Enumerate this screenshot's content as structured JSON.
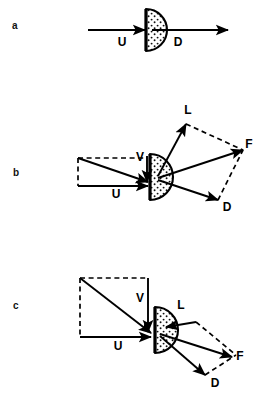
{
  "figure": {
    "type": "scientific-vector-diagram",
    "background_color": "#ffffff",
    "ink_color": "#000000",
    "panels": [
      {
        "id": "a",
        "label": "a",
        "label_x": 12,
        "label_y": 21,
        "body": {
          "shape": "half-disc-stippled",
          "center_x": 146,
          "center_y": 30,
          "radius": 21,
          "flat_edge": "left"
        },
        "vectors": [
          {
            "name": "U",
            "label": "U",
            "label_x": 122,
            "label_y": 46,
            "style": "solid",
            "x1": 88,
            "y1": 30,
            "x2": 145,
            "y2": 30
          },
          {
            "name": "D",
            "label": "D",
            "label_x": 178,
            "label_y": 46,
            "style": "solid",
            "x1": 152,
            "y1": 30,
            "x2": 228,
            "y2": 30
          }
        ],
        "dashed_construction": []
      },
      {
        "id": "b",
        "label": "b",
        "label_x": 13,
        "label_y": 168,
        "body": {
          "shape": "half-disc-stippled",
          "center_x": 150,
          "center_y": 177,
          "radius": 23,
          "flat_edge": "left"
        },
        "vectors": [
          {
            "name": "U",
            "label": "U",
            "label_x": 116,
            "label_y": 198,
            "style": "solid",
            "x1": 78,
            "y1": 186,
            "x2": 148,
            "y2": 186
          },
          {
            "name": "V",
            "label": "V",
            "label_x": 140,
            "label_y": 161,
            "style": "solid",
            "x1": 147,
            "y1": 156,
            "x2": 147,
            "y2": 182
          },
          {
            "name": "resultant",
            "label": "",
            "label_x": 0,
            "label_y": 0,
            "style": "solid",
            "x1": 78,
            "y1": 158,
            "x2": 148,
            "y2": 182
          },
          {
            "name": "L",
            "label": "L",
            "label_x": 188,
            "label_y": 114,
            "style": "solid",
            "x1": 158,
            "y1": 176,
            "x2": 186,
            "y2": 124
          },
          {
            "name": "F",
            "label": "F",
            "label_x": 249,
            "label_y": 148,
            "style": "solid",
            "x1": 158,
            "y1": 178,
            "x2": 243,
            "y2": 150
          },
          {
            "name": "D",
            "label": "D",
            "label_x": 227,
            "label_y": 211,
            "style": "solid",
            "x1": 158,
            "y1": 180,
            "x2": 218,
            "y2": 200
          }
        ],
        "dashed_construction": [
          {
            "name": "rect-top",
            "x1": 78,
            "y1": 158,
            "x2": 147,
            "y2": 158
          },
          {
            "name": "rect-left",
            "x1": 78,
            "y1": 158,
            "x2": 78,
            "y2": 186
          },
          {
            "name": "par-L-F",
            "x1": 186,
            "y1": 124,
            "x2": 243,
            "y2": 150
          },
          {
            "name": "par-D-F",
            "x1": 218,
            "y1": 200,
            "x2": 243,
            "y2": 150
          }
        ]
      },
      {
        "id": "c",
        "label": "c",
        "label_x": 13,
        "label_y": 301,
        "body": {
          "shape": "half-disc-stippled",
          "center_x": 155,
          "center_y": 330,
          "radius": 23,
          "flat_edge": "left"
        },
        "vectors": [
          {
            "name": "U",
            "label": "U",
            "label_x": 118,
            "label_y": 350,
            "style": "solid",
            "x1": 80,
            "y1": 337,
            "x2": 151,
            "y2": 337
          },
          {
            "name": "V",
            "label": "V",
            "label_x": 140,
            "label_y": 302,
            "style": "solid",
            "x1": 148,
            "y1": 278,
            "x2": 148,
            "y2": 332
          },
          {
            "name": "resultant",
            "label": "",
            "label_x": 0,
            "label_y": 0,
            "style": "solid",
            "x1": 80,
            "y1": 278,
            "x2": 151,
            "y2": 333
          },
          {
            "name": "L",
            "label": "L",
            "label_x": 181,
            "label_y": 309,
            "style": "solid",
            "x1": 196,
            "y1": 322,
            "x2": 166,
            "y2": 327
          },
          {
            "name": "F",
            "label": "F",
            "label_x": 240,
            "label_y": 360,
            "style": "solid",
            "x1": 160,
            "y1": 334,
            "x2": 232,
            "y2": 357
          },
          {
            "name": "D",
            "label": "D",
            "label_x": 215,
            "label_y": 387,
            "style": "solid",
            "x1": 160,
            "y1": 336,
            "x2": 205,
            "y2": 375
          }
        ],
        "dashed_construction": [
          {
            "name": "rect-top",
            "x1": 80,
            "y1": 278,
            "x2": 148,
            "y2": 278
          },
          {
            "name": "rect-left",
            "x1": 80,
            "y1": 278,
            "x2": 80,
            "y2": 337
          },
          {
            "name": "par-L-F",
            "x1": 196,
            "y1": 322,
            "x2": 236,
            "y2": 355
          },
          {
            "name": "par-D-F",
            "x1": 205,
            "y1": 375,
            "x2": 236,
            "y2": 355
          }
        ]
      }
    ],
    "caption_visible_fragment": ""
  }
}
